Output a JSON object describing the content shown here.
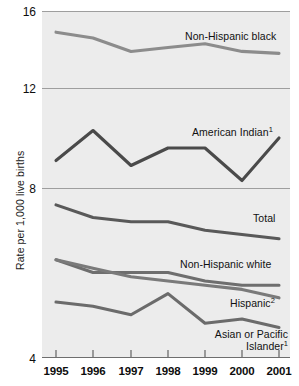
{
  "chart_data": {
    "type": "line",
    "title": "",
    "subtitle": "",
    "xlabel": "",
    "ylabel": "Rate per 1,000 live births",
    "x": [
      1995,
      1996,
      1997,
      1998,
      1999,
      2000,
      2001
    ],
    "categories": [
      "1995",
      "1996",
      "1997",
      "1998",
      "1999",
      "2000",
      "2001"
    ],
    "ylim": [
      4,
      16
    ],
    "y_ticks": [
      4,
      8,
      12,
      16
    ],
    "y_tick_labels": [
      "4",
      "8",
      "12",
      "16"
    ],
    "grid": "horizontal",
    "legend_position": "inline-right",
    "axis_note": "segmented y-axis: 4-8 occupies lower panel, 8-12 middle, 12-16 upper",
    "series": [
      {
        "name": "Non-Hispanic black",
        "label": "Non-Hispanic black",
        "color": "#8c8c8c",
        "values": [
          14.9,
          14.6,
          13.9,
          14.1,
          14.3,
          13.9,
          13.8
        ]
      },
      {
        "name": "American Indian",
        "label": "American Indian",
        "footnote": "1",
        "color": "#4a4a4a",
        "values": [
          9.1,
          10.3,
          8.9,
          9.6,
          9.6,
          8.3,
          10.0
        ]
      },
      {
        "name": "Total",
        "label": "Total",
        "color": "#595959",
        "values": [
          7.6,
          7.3,
          7.2,
          7.2,
          7.0,
          6.9,
          6.8
        ]
      },
      {
        "name": "Non-Hispanic white",
        "label": "Non-Hispanic white",
        "color": "#6e6e6e",
        "values": [
          6.3,
          6.0,
          6.0,
          6.0,
          5.8,
          5.7,
          5.7
        ]
      },
      {
        "name": "Hispanic",
        "label": "Hispanic",
        "footnote": "2",
        "color": "#7a7a7a",
        "values": [
          6.3,
          6.1,
          5.9,
          5.8,
          5.7,
          5.6,
          5.4
        ]
      },
      {
        "name": "Asian or Pacific Islander",
        "label": "Asian or Pacific Islander",
        "footnote": "1",
        "color": "#6b6b6b",
        "values": [
          5.3,
          5.2,
          5.0,
          5.5,
          4.8,
          4.9,
          4.7
        ]
      }
    ]
  },
  "axis": {
    "y_title": "Rate per 1,000 live births",
    "y_labels": [
      "16",
      "12",
      "8",
      "4"
    ],
    "x_labels": [
      "1995",
      "1996",
      "1997",
      "1998",
      "1999",
      "2000",
      "2001"
    ]
  },
  "labels": {
    "non_hispanic_black": "Non-Hispanic black",
    "american_indian": "American Indian",
    "american_indian_fn": "1",
    "total": "Total",
    "non_hispanic_white": "Non-Hispanic white",
    "hispanic": "Hispanic",
    "hispanic_fn": "2",
    "asian_pacific_line1": "Asian or Pacific",
    "asian_pacific_line2": "Islander",
    "asian_pacific_fn": "1"
  },
  "colors": {
    "plot_background": "#ececec",
    "page_background": "#ffffff",
    "gridline": "#9e9e9e",
    "axis_text": "#0d0d0d"
  }
}
